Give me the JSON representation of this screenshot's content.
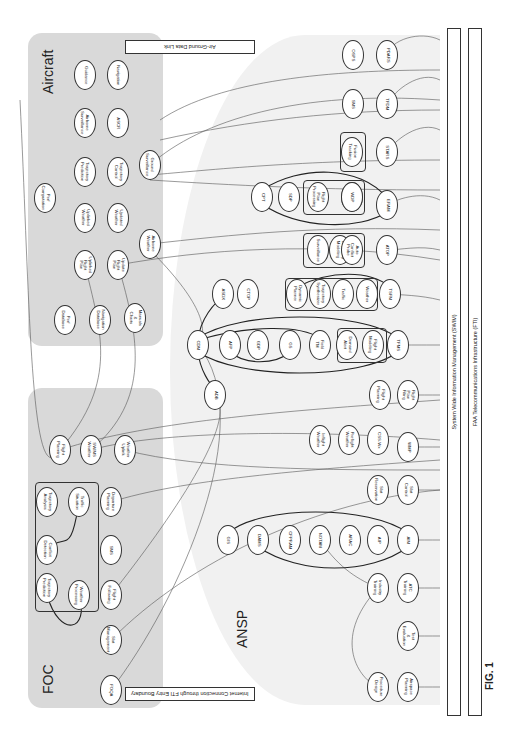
{
  "regions": {
    "aircraft": {
      "label": "Aircraft"
    },
    "foc": {
      "label": "FOC"
    },
    "ansp": {
      "label": "ANSP"
    }
  },
  "bars": {
    "air_ground": "Air-Ground Data Link",
    "internet": "Internet Connection through FTI Entry Boundary",
    "swim": "System Wide Information Management (SWIM)",
    "fti": "FAA Telecommunications Infrastructure (FTI)"
  },
  "figure_label": "FIG. 1",
  "colors": {
    "region_fill": "#d9d9d9",
    "ansp_fill": "#f1f1f1",
    "stroke": "#333333"
  },
  "aircraft_nodes": [
    {
      "id": "guidance",
      "label": "Guidance",
      "x": 85,
      "y": 75
    },
    {
      "id": "navigation",
      "label": "Navigation",
      "x": 118,
      "y": 75
    },
    {
      "id": "airborne_surveillance",
      "label": "Airborne Surveillance",
      "x": 85,
      "y": 123
    },
    {
      "id": "ascr",
      "label": "ASCR",
      "x": 118,
      "y": 123
    },
    {
      "id": "trajectory_prediction",
      "label": "Trajectory Prediction",
      "x": 85,
      "y": 172
    },
    {
      "id": "trajectory_control",
      "label": "Trajectory Control",
      "x": 118,
      "y": 172
    },
    {
      "id": "ground_surveillance",
      "label": "Ground Surveillance",
      "x": 150,
      "y": 165
    },
    {
      "id": "perf_computation",
      "label": "Perf Computation",
      "x": 45,
      "y": 198
    },
    {
      "id": "uplinked_weather",
      "label": "Uplinked Weather",
      "x": 85,
      "y": 218
    },
    {
      "id": "updated_weather",
      "label": "Updated Weather",
      "x": 118,
      "y": 218
    },
    {
      "id": "airborne_weather",
      "label": "Airborne Weather",
      "x": 150,
      "y": 244
    },
    {
      "id": "uplinked_flight_plan",
      "label": "Uplinked Flight Plan",
      "x": 85,
      "y": 265
    },
    {
      "id": "update_flight_plan",
      "label": "Update Flight Plan",
      "x": 118,
      "y": 265
    },
    {
      "id": "perf_database",
      "label": "Perf Database",
      "x": 65,
      "y": 320
    },
    {
      "id": "navigation_database",
      "label": "Navigation Database",
      "x": 100,
      "y": 320
    },
    {
      "id": "manuals_charts",
      "label": "Manuals & Charts",
      "x": 135,
      "y": 318
    }
  ],
  "foc_nodes": [
    {
      "id": "flight_planning_foc",
      "label": "Flight Planning",
      "x": 60,
      "y": 450
    },
    {
      "id": "swims_weather",
      "label": "SWIMS Weather",
      "x": 91,
      "y": 450
    },
    {
      "id": "weather_uplink",
      "label": "Weather Uplink",
      "x": 125,
      "y": 450
    },
    {
      "id": "trajectory_analysis",
      "label": "Trajectory Analysis",
      "x": 47,
      "y": 502
    },
    {
      "id": "traffic_situation",
      "label": "Traffic Situation",
      "x": 79,
      "y": 502
    },
    {
      "id": "departure_planning",
      "label": "Departure Planning",
      "x": 111,
      "y": 502
    },
    {
      "id": "conflict_detection",
      "label": "Conflict Detection",
      "x": 47,
      "y": 550
    },
    {
      "id": "sms_foc",
      "label": "SMS",
      "x": 111,
      "y": 550
    },
    {
      "id": "trajectory_prediction_foc",
      "label": "Trajectory Prediction",
      "x": 47,
      "y": 588
    },
    {
      "id": "weather_processing",
      "label": "Weather Processing",
      "x": 79,
      "y": 595
    },
    {
      "id": "flight_following",
      "label": "Flight Following",
      "x": 111,
      "y": 595
    },
    {
      "id": "slot_management",
      "label": "Slot Management",
      "x": 111,
      "y": 640
    },
    {
      "id": "foqa",
      "label": "FOQA",
      "x": 111,
      "y": 690
    }
  ],
  "foc_group": {
    "label": "Trajectory Management"
  },
  "ansp_nodes": [
    {
      "id": "osps",
      "label": "OSPS",
      "x": 353,
      "y": 55
    },
    {
      "id": "pdars",
      "label": "PDARS",
      "x": 387,
      "y": 55
    },
    {
      "id": "sms",
      "label": "SMS",
      "x": 353,
      "y": 104
    },
    {
      "id": "tfdm",
      "label": "TFDM",
      "x": 387,
      "y": 104
    },
    {
      "id": "fusion_tracking",
      "label": "Fusion Tracking",
      "x": 352,
      "y": 152
    },
    {
      "id": "stars",
      "label": "STARS",
      "x": 387,
      "y": 152
    },
    {
      "id": "cpt",
      "label": "CPT",
      "x": 262,
      "y": 197
    },
    {
      "id": "sdp",
      "label": "SDP",
      "x": 289,
      "y": 197
    },
    {
      "id": "flight_plan_processing",
      "label": "Flight Plan Processing",
      "x": 318,
      "y": 197
    },
    {
      "id": "trajectory_modeling_erm",
      "label": "Trajectory Modeling",
      "x": 352,
      "y": 197
    },
    {
      "id": "wdp",
      "label": "WDP",
      "x": 352,
      "y": 197
    },
    {
      "id": "eram",
      "label": "ERAM",
      "x": 387,
      "y": 205
    },
    {
      "id": "surveillance",
      "label": "Surveillance",
      "x": 318,
      "y": 250
    },
    {
      "id": "trajectory_modeling_atop",
      "label": "Trajectory Modeling",
      "x": 340,
      "y": 250
    },
    {
      "id": "auto_conflict_probe",
      "label": "Auto Conflict Probe",
      "x": 352,
      "y": 250
    },
    {
      "id": "atop",
      "label": "ATOP",
      "x": 387,
      "y": 250
    },
    {
      "id": "asdx",
      "label": "ASDX",
      "x": 223,
      "y": 294
    },
    {
      "id": "ctop",
      "label": "CTOP",
      "x": 248,
      "y": 294
    },
    {
      "id": "dynamic_planner",
      "label": "Dynamic Planner",
      "x": 297,
      "y": 294
    },
    {
      "id": "trajectory_synthesizer",
      "label": "Trajectory Synthesizer",
      "x": 320,
      "y": 294
    },
    {
      "id": "traffic",
      "label": "Traffic",
      "x": 343,
      "y": 294
    },
    {
      "id": "weather",
      "label": "Weather",
      "x": 367,
      "y": 294
    },
    {
      "id": "tsfm",
      "label": "TSFM",
      "x": 390,
      "y": 294
    },
    {
      "id": "cdm",
      "label": "CDM",
      "x": 198,
      "y": 345
    },
    {
      "id": "afp",
      "label": "AFP",
      "x": 230,
      "y": 345
    },
    {
      "id": "gdp",
      "label": "GDP",
      "x": 258,
      "y": 345
    },
    {
      "id": "gs",
      "label": "GS",
      "x": 290,
      "y": 345
    },
    {
      "id": "field_tm",
      "label": "Field TM",
      "x": 320,
      "y": 345
    },
    {
      "id": "demand_alert",
      "label": "Demand Alert",
      "x": 347,
      "y": 345
    },
    {
      "id": "flight_modeling",
      "label": "Flight Modeling",
      "x": 373,
      "y": 345
    },
    {
      "id": "tfms",
      "label": "TFMS",
      "x": 398,
      "y": 345
    },
    {
      "id": "adb",
      "label": "ADB",
      "x": 215,
      "y": 395
    },
    {
      "id": "flight_planning",
      "label": "Flight Planning",
      "x": 380,
      "y": 395
    },
    {
      "id": "flight_plan_filing",
      "label": "Flight Plan Filing",
      "x": 408,
      "y": 395
    },
    {
      "id": "inflight_weather",
      "label": "Inflight Weather",
      "x": 320,
      "y": 440
    },
    {
      "id": "preflight_weather",
      "label": "Preflight Weather",
      "x": 349,
      "y": 440
    },
    {
      "id": "css_wx",
      "label": "CSS-Wx",
      "x": 378,
      "y": 440
    },
    {
      "id": "wmp",
      "label": "WMP",
      "x": 408,
      "y": 447
    },
    {
      "id": "slot_reservation",
      "label": "Slot Reservation",
      "x": 378,
      "y": 490
    },
    {
      "id": "slot_control",
      "label": "Slot Control",
      "x": 408,
      "y": 490
    },
    {
      "id": "gis",
      "label": "GIS",
      "x": 228,
      "y": 540
    },
    {
      "id": "dams",
      "label": "DAMS",
      "x": 258,
      "y": 540
    },
    {
      "id": "cfpram",
      "label": "CFPRAM",
      "x": 290,
      "y": 540
    },
    {
      "id": "notam",
      "label": "NOTAM",
      "x": 320,
      "y": 540
    },
    {
      "id": "arac",
      "label": "ARAC",
      "x": 350,
      "y": 540
    },
    {
      "id": "aip",
      "label": "AIP",
      "x": 378,
      "y": 540
    },
    {
      "id": "aim",
      "label": "AIM",
      "x": 408,
      "y": 540
    },
    {
      "id": "industry_training",
      "label": "Industry Training",
      "x": 378,
      "y": 588
    },
    {
      "id": "atc_training",
      "label": "ATC Training",
      "x": 408,
      "y": 588
    },
    {
      "id": "test_evaluation",
      "label": "Test & Evaluation",
      "x": 408,
      "y": 636
    },
    {
      "id": "procedure_design",
      "label": "Procedure Design",
      "x": 378,
      "y": 687
    },
    {
      "id": "airspace_planning",
      "label": "Airspace Planning",
      "x": 408,
      "y": 687
    }
  ],
  "ansp_groups": [
    {
      "id": "erm_group",
      "label": "ERAM"
    },
    {
      "id": "atop_group",
      "label": "ATOP"
    },
    {
      "id": "tsfm_group",
      "label": "TSFM"
    },
    {
      "id": "tfms_group",
      "label": "TFMS"
    },
    {
      "id": "stars_group",
      "label": "STARS"
    }
  ]
}
